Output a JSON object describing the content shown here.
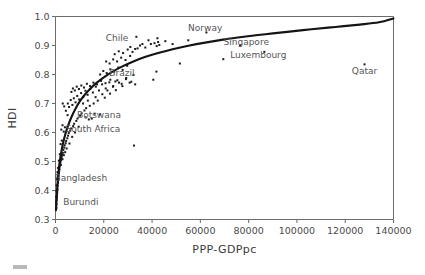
{
  "chart_data": {
    "type": "scatter",
    "title": "",
    "xlabel": "PPP-GDPpc",
    "ylabel": "HDI",
    "xlim": [
      0,
      140000
    ],
    "ylim": [
      0.3,
      1.0
    ],
    "grid": false,
    "legend": null,
    "xticks": [
      0,
      20000,
      40000,
      60000,
      80000,
      100000,
      120000,
      140000
    ],
    "xtick_labels": [
      "0",
      "20000",
      "40000",
      "60000",
      "80000",
      "100000",
      "120000",
      "140000"
    ],
    "yticks": [
      0.3,
      0.4,
      0.5,
      0.6,
      0.7,
      0.8,
      0.9,
      1.0
    ],
    "ytick_labels": [
      "0.3",
      "0.4",
      "0.5",
      "0.6",
      "0.7",
      "0.8",
      "0.9",
      "1.0"
    ],
    "annotations": [
      {
        "label": "Chile",
        "x": 25500,
        "y": 0.925
      },
      {
        "label": "Norway",
        "x": 62000,
        "y": 0.96
      },
      {
        "label": "Singapore",
        "x": 79000,
        "y": 0.912
      },
      {
        "label": "Luxembourg",
        "x": 84000,
        "y": 0.867
      },
      {
        "label": "Qatar",
        "x": 128000,
        "y": 0.812
      },
      {
        "label": "Brazil",
        "x": 27500,
        "y": 0.805
      },
      {
        "label": "Botswana",
        "x": 18000,
        "y": 0.66
      },
      {
        "label": "South Africa",
        "x": 15500,
        "y": 0.612
      },
      {
        "label": "Bangladesh",
        "x": 10500,
        "y": 0.445
      },
      {
        "label": "Burundi",
        "x": 10500,
        "y": 0.362
      }
    ],
    "fit_curve": {
      "name": "logarithmic fit",
      "points": [
        [
          200,
          0.332
        ],
        [
          600,
          0.395
        ],
        [
          1100,
          0.452
        ],
        [
          1700,
          0.497
        ],
        [
          2400,
          0.533
        ],
        [
          3200,
          0.566
        ],
        [
          4200,
          0.598
        ],
        [
          5400,
          0.628
        ],
        [
          6800,
          0.657
        ],
        [
          8400,
          0.684
        ],
        [
          10200,
          0.709
        ],
        [
          12200,
          0.731
        ],
        [
          14500,
          0.752
        ],
        [
          17000,
          0.771
        ],
        [
          20000,
          0.79
        ],
        [
          23500,
          0.809
        ],
        [
          27500,
          0.827
        ],
        [
          32000,
          0.844
        ],
        [
          37000,
          0.86
        ],
        [
          42500,
          0.874
        ],
        [
          48500,
          0.887
        ],
        [
          55000,
          0.899
        ],
        [
          62000,
          0.91
        ],
        [
          70000,
          0.921
        ],
        [
          78000,
          0.93
        ],
        [
          87000,
          0.939
        ],
        [
          96000,
          0.947
        ],
        [
          106000,
          0.956
        ],
        [
          116000,
          0.964
        ],
        [
          126000,
          0.972
        ],
        [
          134000,
          0.98
        ],
        [
          140000,
          0.993
        ]
      ]
    },
    "points": [
      [
        350,
        0.34
      ],
      [
        420,
        0.352
      ],
      [
        500,
        0.368
      ],
      [
        560,
        0.376
      ],
      [
        620,
        0.383
      ],
      [
        700,
        0.392
      ],
      [
        760,
        0.4
      ],
      [
        820,
        0.405
      ],
      [
        900,
        0.415
      ],
      [
        980,
        0.424
      ],
      [
        1050,
        0.43
      ],
      [
        1150,
        0.437
      ],
      [
        1250,
        0.444
      ],
      [
        1350,
        0.452
      ],
      [
        1450,
        0.46
      ],
      [
        1550,
        0.468
      ],
      [
        1650,
        0.474
      ],
      [
        1750,
        0.482
      ],
      [
        1850,
        0.488
      ],
      [
        1950,
        0.493
      ],
      [
        2050,
        0.498
      ],
      [
        2200,
        0.488
      ],
      [
        2300,
        0.505
      ],
      [
        2450,
        0.512
      ],
      [
        2600,
        0.518
      ],
      [
        2750,
        0.523
      ],
      [
        2900,
        0.508
      ],
      [
        3050,
        0.53
      ],
      [
        3250,
        0.54
      ],
      [
        3450,
        0.522
      ],
      [
        3600,
        0.548
      ],
      [
        3800,
        0.556
      ],
      [
        4000,
        0.532
      ],
      [
        4200,
        0.563
      ],
      [
        4400,
        0.571
      ],
      [
        4600,
        0.545
      ],
      [
        4900,
        0.58
      ],
      [
        5200,
        0.589
      ],
      [
        5500,
        0.598
      ],
      [
        5800,
        0.562
      ],
      [
        6100,
        0.606
      ],
      [
        6500,
        0.614
      ],
      [
        6900,
        0.585
      ],
      [
        7300,
        0.622
      ],
      [
        7700,
        0.63
      ],
      [
        8100,
        0.6
      ],
      [
        8600,
        0.64
      ],
      [
        9100,
        0.648
      ],
      [
        9600,
        0.62
      ],
      [
        10200,
        0.658
      ],
      [
        10800,
        0.666
      ],
      [
        11400,
        0.7
      ],
      [
        12000,
        0.676
      ],
      [
        12700,
        0.684
      ],
      [
        13400,
        0.71
      ],
      [
        14200,
        0.692
      ],
      [
        15000,
        0.648
      ],
      [
        15800,
        0.7
      ],
      [
        16600,
        0.722
      ],
      [
        17500,
        0.71
      ],
      [
        18400,
        0.662
      ],
      [
        19400,
        0.732
      ],
      [
        20400,
        0.72
      ],
      [
        21500,
        0.745
      ],
      [
        22600,
        0.734
      ],
      [
        23800,
        0.758
      ],
      [
        25000,
        0.746
      ],
      [
        26300,
        0.772
      ],
      [
        27700,
        0.76
      ],
      [
        29200,
        0.784
      ],
      [
        30700,
        0.772
      ],
      [
        32300,
        0.798
      ],
      [
        2400,
        0.61
      ],
      [
        2900,
        0.625
      ],
      [
        3400,
        0.603
      ],
      [
        3900,
        0.618
      ],
      [
        5100,
        0.7
      ],
      [
        5600,
        0.688
      ],
      [
        6300,
        0.712
      ],
      [
        7000,
        0.695
      ],
      [
        7600,
        0.718
      ],
      [
        8300,
        0.704
      ],
      [
        9000,
        0.726
      ],
      [
        9800,
        0.714
      ],
      [
        10600,
        0.736
      ],
      [
        11500,
        0.722
      ],
      [
        12400,
        0.744
      ],
      [
        13300,
        0.73
      ],
      [
        14400,
        0.75
      ],
      [
        15500,
        0.738
      ],
      [
        16700,
        0.758
      ],
      [
        18000,
        0.745
      ],
      [
        19300,
        0.766
      ],
      [
        20800,
        0.752
      ],
      [
        22300,
        0.773
      ],
      [
        23900,
        0.76
      ],
      [
        25600,
        0.78
      ],
      [
        27400,
        0.768
      ],
      [
        29300,
        0.788
      ],
      [
        31400,
        0.775
      ],
      [
        6600,
        0.74
      ],
      [
        7200,
        0.752
      ],
      [
        8000,
        0.745
      ],
      [
        8800,
        0.758
      ],
      [
        9700,
        0.75
      ],
      [
        10700,
        0.762
      ],
      [
        11800,
        0.755
      ],
      [
        13000,
        0.768
      ],
      [
        14300,
        0.76
      ],
      [
        15700,
        0.772
      ],
      [
        17200,
        0.766
      ],
      [
        18900,
        0.778
      ],
      [
        20700,
        0.77
      ],
      [
        22700,
        0.782
      ],
      [
        24800,
        0.776
      ],
      [
        18500,
        0.8
      ],
      [
        19800,
        0.812
      ],
      [
        21200,
        0.805
      ],
      [
        22700,
        0.818
      ],
      [
        24300,
        0.81
      ],
      [
        26000,
        0.824
      ],
      [
        27800,
        0.816
      ],
      [
        29700,
        0.83
      ],
      [
        21000,
        0.845
      ],
      [
        22400,
        0.838
      ],
      [
        23900,
        0.852
      ],
      [
        25500,
        0.845
      ],
      [
        27200,
        0.858
      ],
      [
        29000,
        0.85
      ],
      [
        30900,
        0.864
      ],
      [
        24500,
        0.87
      ],
      [
        26200,
        0.88
      ],
      [
        28000,
        0.874
      ],
      [
        29900,
        0.886
      ],
      [
        31900,
        0.878
      ],
      [
        34000,
        0.89
      ],
      [
        31000,
        0.895
      ],
      [
        33000,
        0.888
      ],
      [
        35000,
        0.9
      ],
      [
        37200,
        0.893
      ],
      [
        39500,
        0.905
      ],
      [
        41900,
        0.898
      ],
      [
        42500,
        0.912
      ],
      [
        33500,
        0.93
      ],
      [
        36000,
        0.905
      ],
      [
        38500,
        0.918
      ],
      [
        41000,
        0.908
      ],
      [
        42200,
        0.925
      ],
      [
        43000,
        0.902
      ],
      [
        40500,
        0.782
      ],
      [
        41800,
        0.81
      ],
      [
        33000,
        0.766
      ],
      [
        32500,
        0.555
      ],
      [
        45500,
        0.915
      ],
      [
        48500,
        0.905
      ],
      [
        51500,
        0.838
      ],
      [
        55000,
        0.918
      ],
      [
        62500,
        0.945
      ],
      [
        69500,
        0.853
      ],
      [
        76500,
        0.9
      ],
      [
        86500,
        0.878
      ],
      [
        128000,
        0.835
      ],
      [
        3000,
        0.7
      ],
      [
        3600,
        0.69
      ],
      [
        4300,
        0.675
      ],
      [
        5000,
        0.66
      ],
      [
        12500,
        0.652
      ],
      [
        13800,
        0.645
      ],
      [
        16200,
        0.665
      ],
      [
        2100,
        0.56
      ],
      [
        2600,
        0.572
      ],
      [
        1800,
        0.525
      ],
      [
        1400,
        0.503
      ],
      [
        1000,
        0.478
      ],
      [
        800,
        0.463
      ],
      [
        640,
        0.44
      ],
      [
        480,
        0.418
      ],
      [
        380,
        0.398
      ],
      [
        300,
        0.378
      ],
      [
        250,
        0.36
      ]
    ]
  }
}
